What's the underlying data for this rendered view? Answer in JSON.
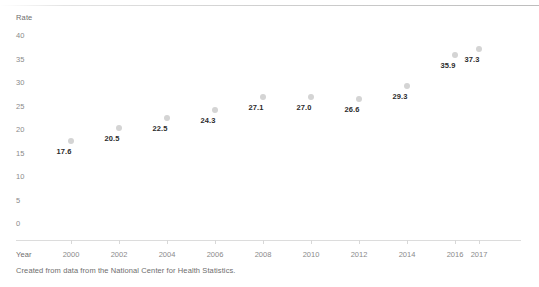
{
  "chart_data": {
    "type": "scatter",
    "title": "",
    "xlabel": "Year",
    "ylabel": "Rate",
    "x": [
      2000,
      2002,
      2004,
      2006,
      2008,
      2010,
      2012,
      2014,
      2016,
      2017
    ],
    "values": [
      17.6,
      20.5,
      22.5,
      24.3,
      27.1,
      27.0,
      26.6,
      29.3,
      35.9,
      37.3
    ],
    "point_labels": [
      "17.6",
      "20.5",
      "22.5",
      "24.3",
      "27.1",
      "27.0",
      "26.6",
      "29.3",
      "35.9",
      "37.3"
    ],
    "xtick_labels": [
      "2000",
      "2002",
      "2004",
      "2006",
      "2008",
      "2010",
      "2012",
      "2014",
      "2016",
      "2017"
    ],
    "ytick_labels": [
      "40",
      "35",
      "30",
      "25",
      "20",
      "15",
      "10",
      "5",
      "0"
    ],
    "ytick_values": [
      40,
      35,
      30,
      25,
      20,
      15,
      10,
      5,
      0
    ],
    "ylim": [
      0,
      40
    ],
    "xlim": [
      2000,
      2017
    ],
    "grid": false,
    "legend": null,
    "marker_color": "#d4d4d4",
    "label_color": "#2b2b2b",
    "axis_color": "#dcdcdc",
    "tick_text_color": "#8a8a8a"
  },
  "footer": {
    "source_note": "Created from data from the National Center for Health Statistics."
  }
}
